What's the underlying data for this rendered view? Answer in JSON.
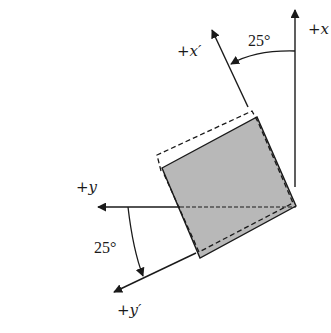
{
  "figure": {
    "labels": {
      "x_axis": "+x",
      "x_prime_axis": "+x′",
      "y_axis": "+y",
      "y_prime_axis": "+y′",
      "angle_top": "25°",
      "angle_bottom": "25°"
    },
    "rotation_angle_deg": 25,
    "colors": {
      "line": "#1a1a1a",
      "fill": "#b8b8b8",
      "background": "#ffffff"
    },
    "elements": {
      "solid_square": "rotated element (shaded)",
      "dashed_square": "deformed element outline"
    }
  }
}
